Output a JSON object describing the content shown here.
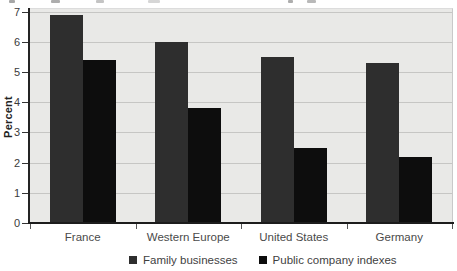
{
  "chart_data": {
    "type": "bar",
    "title": "",
    "xlabel": "",
    "ylabel": "Percent",
    "ylim": [
      0,
      7
    ],
    "grid": true,
    "legend_position": "bottom",
    "categories": [
      "France",
      "Western Europe",
      "United States",
      "Germany"
    ],
    "series": [
      {
        "name": "Family businesses",
        "color": "#2e2e2e",
        "values": [
          6.9,
          6.0,
          5.5,
          5.3
        ]
      },
      {
        "name": "Public company indexes",
        "color": "#0d0d0d",
        "values": [
          5.4,
          3.8,
          2.5,
          2.2
        ]
      }
    ],
    "y_tick_labels": [
      "0",
      "1",
      "2",
      "3",
      "4",
      "5",
      "6",
      "7"
    ]
  }
}
